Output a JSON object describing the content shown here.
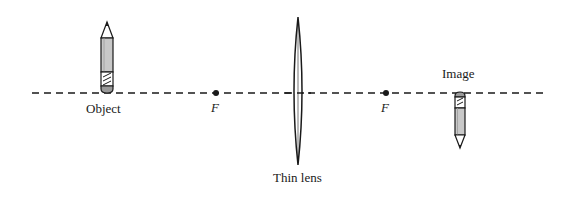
{
  "diagram": {
    "type": "thin-lens-ray-setup",
    "optical_axis": {
      "style": "dashed",
      "y": 93,
      "x_start": 32,
      "x_end": 548
    },
    "labels": {
      "object": "Object",
      "image": "Image",
      "focal_left": "F",
      "focal_right": "F",
      "lens": "Thin lens"
    },
    "elements": {
      "object": {
        "kind": "pencil",
        "orientation": "upright",
        "x": 107
      },
      "image": {
        "kind": "pencil",
        "orientation": "inverted",
        "x": 460
      },
      "lens": {
        "kind": "biconvex-thin-lens",
        "x": 298
      },
      "focal_points": [
        {
          "x": 216
        },
        {
          "x": 386
        }
      ]
    },
    "colors": {
      "line": "#1a1a1a",
      "pencil_body": "#c8c8c8",
      "background": "#ffffff"
    }
  }
}
